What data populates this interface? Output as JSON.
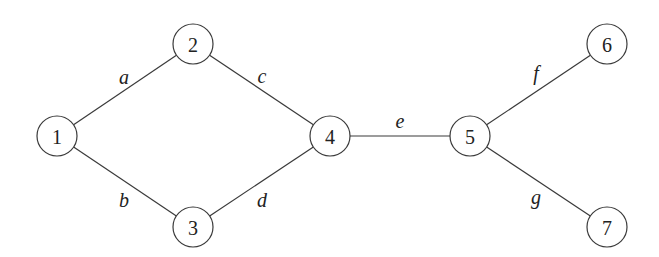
{
  "graph": {
    "node_radius": 20,
    "colors": {
      "stroke": "#3a3a3a",
      "text": "#222222",
      "background": "#ffffff"
    },
    "nodes": [
      {
        "id": "1",
        "label": "1",
        "x": 57,
        "y": 136
      },
      {
        "id": "2",
        "label": "2",
        "x": 193,
        "y": 44
      },
      {
        "id": "3",
        "label": "3",
        "x": 193,
        "y": 227
      },
      {
        "id": "4",
        "label": "4",
        "x": 330,
        "y": 136
      },
      {
        "id": "5",
        "label": "5",
        "x": 470,
        "y": 136
      },
      {
        "id": "6",
        "label": "6",
        "x": 607,
        "y": 44
      },
      {
        "id": "7",
        "label": "7",
        "x": 607,
        "y": 227
      }
    ],
    "edges": [
      {
        "label": "a",
        "from": "1",
        "to": "2",
        "lx": 124,
        "ly": 77
      },
      {
        "label": "b",
        "from": "1",
        "to": "3",
        "lx": 124,
        "ly": 200
      },
      {
        "label": "c",
        "from": "2",
        "to": "4",
        "lx": 262,
        "ly": 76
      },
      {
        "label": "d",
        "from": "3",
        "to": "4",
        "lx": 262,
        "ly": 200
      },
      {
        "label": "e",
        "from": "4",
        "to": "5",
        "lx": 400,
        "ly": 121
      },
      {
        "label": "f",
        "from": "5",
        "to": "6",
        "lx": 536,
        "ly": 73
      },
      {
        "label": "g",
        "from": "5",
        "to": "7",
        "lx": 536,
        "ly": 197
      }
    ]
  }
}
